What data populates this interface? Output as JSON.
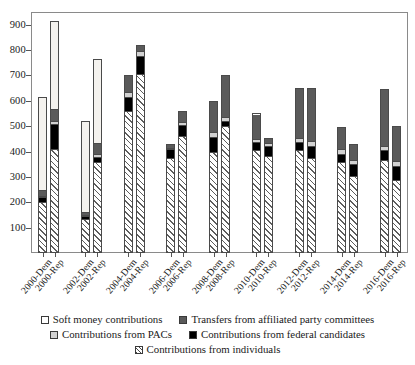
{
  "chart_data": {
    "type": "bar",
    "stacked": true,
    "title": "",
    "subtitle": "",
    "xlabel": "",
    "ylabel": "",
    "ylim": [
      0,
      950
    ],
    "ytick_values": [
      100,
      200,
      300,
      400,
      500,
      600,
      700,
      800,
      900
    ],
    "ytick_labels": [
      "100",
      "200",
      "300",
      "400",
      "500",
      "600",
      "700",
      "800",
      "900"
    ],
    "grid": false,
    "legend_position": "bottom",
    "categories": [
      "2000-Dem",
      "2000-Rep",
      "2002-Dem",
      "2002-Rep",
      "2004-Dem",
      "2004-Rep",
      "2006-Dem",
      "2006-Rep",
      "2008-Dem",
      "2008-Rep",
      "2010-Dem",
      "2010-Rep",
      "2012-Dem",
      "2012-Rep",
      "2014-Dem",
      "2014-Rep",
      "2016-Dem",
      "2016-Rep"
    ],
    "series": [
      {
        "name": "Contributions from individuals",
        "key": "individuals",
        "color": "#ffffff",
        "pattern": "diagonal-hatch",
        "values": [
          195,
          405,
          130,
          355,
          560,
          705,
          375,
          460,
          395,
          500,
          405,
          380,
          405,
          370,
          355,
          300,
          365,
          285
        ]
      },
      {
        "name": "Contributions from federal candidates",
        "key": "fedcand",
        "color": "#000000",
        "pattern": "solid",
        "values": [
          20,
          100,
          10,
          20,
          55,
          70,
          35,
          45,
          60,
          20,
          30,
          40,
          30,
          50,
          35,
          50,
          40,
          55
        ]
      },
      {
        "name": "Contributions from PACs",
        "key": "pacs",
        "color": "#d2d2d2",
        "pattern": "solid",
        "values": [
          5,
          10,
          5,
          10,
          20,
          20,
          5,
          10,
          20,
          15,
          15,
          15,
          15,
          20,
          20,
          15,
          15,
          20
        ]
      },
      {
        "name": "Transfers from affiliated party committees",
        "key": "transfers",
        "color": "#5a5a5a",
        "pattern": "solid",
        "values": [
          25,
          50,
          10,
          45,
          65,
          25,
          15,
          45,
          125,
          165,
          100,
          20,
          200,
          210,
          85,
          65,
          225,
          140
        ]
      },
      {
        "name": "Soft money contributions",
        "key": "softmoney",
        "color": "#f4f2ee",
        "pattern": "solid",
        "values": [
          370,
          350,
          365,
          335,
          0,
          0,
          0,
          0,
          0,
          0,
          0,
          0,
          0,
          0,
          0,
          0,
          0,
          0
        ]
      }
    ],
    "totals": [
      615,
      915,
      520,
      765,
      700,
      820,
      430,
      560,
      600,
      700,
      550,
      455,
      650,
      650,
      495,
      430,
      645,
      500
    ]
  },
  "legend": {
    "items": [
      {
        "label": "Soft money contributions",
        "swatch": "sw-softmoney"
      },
      {
        "label": "Transfers from affiliated party committees",
        "swatch": "sw-transfers"
      },
      {
        "label": "Contributions from PACs",
        "swatch": "sw-pacs"
      },
      {
        "label": "Contributions from federal candidates",
        "swatch": "sw-fedcand"
      },
      {
        "label": "Contributions from individuals",
        "swatch": "sw-individuals"
      }
    ]
  }
}
